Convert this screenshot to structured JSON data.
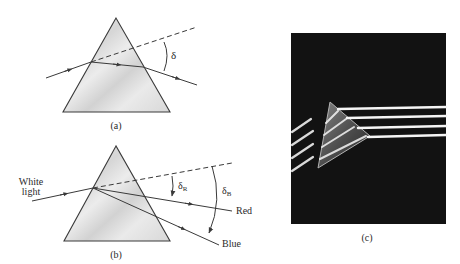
{
  "figure": {
    "panels": [
      {
        "id": "a",
        "caption": "(a)",
        "angle_label": "δ",
        "description": "Monochromatic ray refracted through a prism, deviated by angle δ"
      },
      {
        "id": "b",
        "caption": "(b)",
        "input_label_line1": "White",
        "input_label_line2": "light",
        "red_angle_label": "δ",
        "red_angle_sub": "R",
        "blue_angle_label": "δ",
        "blue_angle_sub": "B",
        "red_ray_label": "Red",
        "blue_ray_label": "Blue",
        "description": "White light dispersed by a prism into red and blue rays with deviations δR and δB"
      },
      {
        "id": "c",
        "caption": "(c)",
        "description": "Photograph of light beams passing through a prism on a dark background"
      }
    ],
    "colors": {
      "line": "#3a3a3a",
      "prism_fill": "#e2e2e2",
      "photo_bg": "#111111",
      "beam": "#f2f2f2"
    }
  }
}
